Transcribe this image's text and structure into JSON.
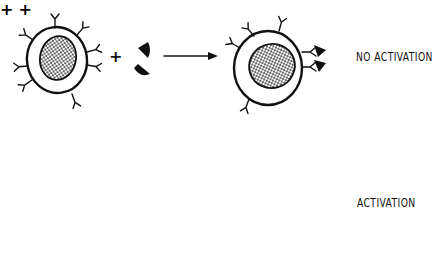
{
  "diagram": {
    "rows": [
      {
        "id": "no-activation",
        "components": [
          "cell-with-receptors",
          "plus",
          "antigen-fragments",
          "arrow",
          "cell-with-bound-antigens"
        ],
        "label": "NO ACTIVATION"
      },
      {
        "id": "activation",
        "components": [
          "cell-with-receptors",
          "plus",
          "antigen-fragments",
          "plus",
          "crosslinking-antibody",
          "arrow",
          "activated-cell-with-crosslinked-receptors"
        ],
        "label": "ACTIVATION"
      }
    ],
    "symbols": {
      "plus": "+",
      "arrow": "→"
    },
    "colors": {
      "ink": "#111111",
      "background": "#ffffff"
    }
  }
}
